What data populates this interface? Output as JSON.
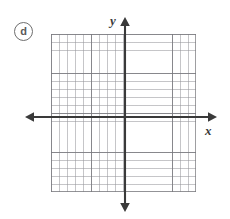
{
  "figure": {
    "part_label": "d",
    "type": "cartesian-coordinate-grid"
  },
  "axes": {
    "x_label": "x",
    "y_label": "y",
    "x_axis_name": "horizontal-axis",
    "y_axis_name": "vertical-axis",
    "axis_color": "#3a3a3a",
    "arrowheads": [
      "left",
      "right",
      "up",
      "down"
    ]
  },
  "grid": {
    "columns": 18,
    "rows": 20,
    "cell_px": 8,
    "major_every": 5,
    "minor_line_color": "#9a9a9f",
    "major_line_color": "#78787d",
    "background_color": "#ffffff",
    "origin_column_from_left": 9,
    "origin_row_from_top": 10
  },
  "page": {
    "background_color": "#ffffff"
  }
}
